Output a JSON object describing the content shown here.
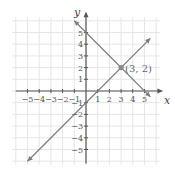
{
  "chart_data": {
    "type": "line",
    "title": "",
    "xlabel": "x",
    "ylabel": "y",
    "xlim": [
      -5.5,
      5.5
    ],
    "ylim": [
      -5.5,
      5.5
    ],
    "grid": true,
    "x_ticks": [
      "-5",
      "-4",
      "-3",
      "-2",
      "-1",
      "1",
      "2",
      "3",
      "4",
      "5"
    ],
    "y_ticks": [
      "5",
      "4",
      "3",
      "2",
      "1",
      "-1",
      "-2",
      "-3",
      "-4",
      "-5"
    ],
    "series": [
      {
        "name": "y = x - 1",
        "x": [
          -5,
          5.5
        ],
        "y": [
          -6,
          4.5
        ]
      },
      {
        "name": "y = -x + 5",
        "x": [
          -1,
          5.5
        ],
        "y": [
          6,
          -0.5
        ]
      }
    ],
    "annotations": [
      {
        "label": "(3, 2)",
        "x": 3,
        "y": 2
      }
    ],
    "colors": {
      "grid": "#e6e6e6",
      "axis": "#555555",
      "line": "#7d7d7d",
      "point": "#8a8a8a"
    }
  }
}
